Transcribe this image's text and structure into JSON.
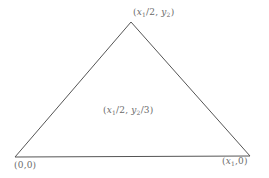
{
  "diagram": {
    "title": "",
    "shape": "triangle",
    "stroke_color": "#555555",
    "label_color": "#6a6a6a",
    "vertices": [
      {
        "id": "origin",
        "label": "(0,0)",
        "x": 15,
        "y": 157
      },
      {
        "id": "right",
        "label": "(x1,0)",
        "x": 250,
        "y": 156
      },
      {
        "id": "apex",
        "label": "(x1/2,y2)",
        "x": 131,
        "y": 22
      }
    ],
    "interior_labels": [
      {
        "id": "centroid",
        "label": "(x1/2,y2/3)"
      }
    ],
    "label_parts": {
      "apex": {
        "open": "(",
        "var1": "x",
        "sub1": "1",
        "mid": "/2, ",
        "var2": "y",
        "sub2": "2",
        "close": ")"
      },
      "origin": {
        "text": "(0,0)"
      },
      "right": {
        "open": "(",
        "var1": "x",
        "sub1": "1",
        "close": ",0)"
      },
      "centroid": {
        "open": "(",
        "var1": "x",
        "sub1": "1",
        "mid": "/2, ",
        "var2": "y",
        "sub2": "2",
        "close": "/3)"
      }
    }
  }
}
